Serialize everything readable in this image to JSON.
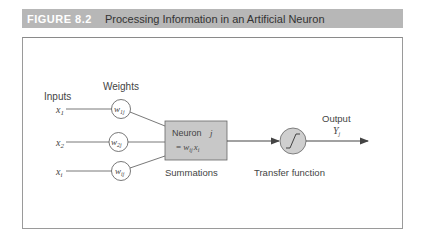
{
  "header": {
    "figure_label": "FIGURE 8.2",
    "title": "Processing Information in an Artificial Neuron"
  },
  "diagram": {
    "inputs_label": "Inputs",
    "weights_label": "Weights",
    "inputs": [
      {
        "symbol": "x",
        "sub": "1"
      },
      {
        "symbol": "x",
        "sub": "2"
      },
      {
        "symbol": "x",
        "sub": "i"
      }
    ],
    "weights": [
      {
        "symbol": "w",
        "sub": "1j"
      },
      {
        "symbol": "w",
        "sub": "2j"
      },
      {
        "symbol": "w",
        "sub": "ij"
      }
    ],
    "neuron": {
      "label": "Neuron",
      "index": "j",
      "formula_prefix": "= ",
      "formula_w": "w",
      "formula_w_sub": "ij",
      "formula_x": "x",
      "formula_x_sub": "i"
    },
    "summations_label": "Summations",
    "transfer_label": "Transfer function",
    "transfer_glyph": "∫",
    "output_label": "Output",
    "output_symbol": "Y",
    "output_sub": "j"
  },
  "colors": {
    "header_bg": "#b7b7b7",
    "neuron_fill": "#c8c8c8",
    "transfer_fill": "#cfcfcf",
    "line": "#555555"
  }
}
